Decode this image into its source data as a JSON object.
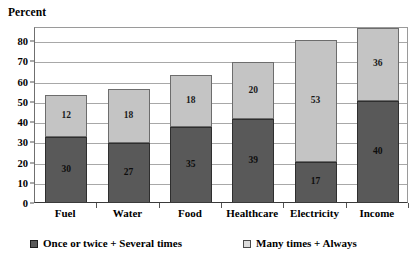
{
  "chart_data": {
    "type": "bar",
    "title": "",
    "ylabel": "Percent",
    "xlabel": "",
    "ylim": [
      0,
      87
    ],
    "yticks": [
      0,
      10,
      20,
      30,
      40,
      50,
      60,
      70,
      80
    ],
    "grid": true,
    "stacked": true,
    "legend_position": "bottom",
    "categories": [
      "Fuel",
      "Water",
      "Food",
      "Healthcare",
      "Electricity",
      "Income"
    ],
    "series": [
      {
        "name": "Once or twice + Several times",
        "color": "#595959",
        "values": [
          30,
          27,
          35,
          39,
          17,
          40
        ],
        "drawn_heights": [
          32,
          29,
          37,
          41,
          20,
          50
        ]
      },
      {
        "name": "Many times + Always",
        "color": "#c4c4c4",
        "values": [
          12,
          18,
          18,
          20,
          53,
          36
        ],
        "drawn_heights": [
          21,
          27,
          26,
          28,
          60,
          36
        ]
      }
    ],
    "bar_totals": [
      53,
      56,
      63,
      69,
      80,
      86
    ]
  },
  "legend": {
    "items": [
      {
        "label": "Once or twice + Several times",
        "swatch": "dark"
      },
      {
        "label": "Many times + Always",
        "swatch": "light"
      }
    ]
  }
}
